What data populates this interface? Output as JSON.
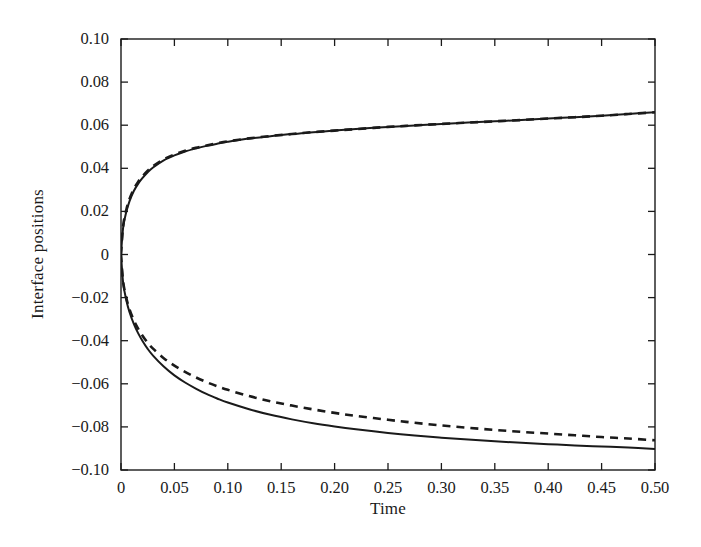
{
  "chart_data": {
    "type": "line",
    "title": "",
    "xlabel": "Time",
    "ylabel": "Interface positions",
    "xlim": [
      0,
      0.5
    ],
    "ylim": [
      -0.1,
      0.1
    ],
    "xticks": [
      0,
      0.05,
      0.1,
      0.15,
      0.2,
      0.25,
      0.3,
      0.35,
      0.4,
      0.45,
      0.5
    ],
    "xticklabels": [
      "0",
      "0.05",
      "0.10",
      "0.15",
      "0.20",
      "0.25",
      "0.30",
      "0.35",
      "0.40",
      "0.45",
      "0.50"
    ],
    "yticks": [
      -0.1,
      -0.08,
      -0.06,
      -0.04,
      -0.02,
      0,
      0.02,
      0.04,
      0.06,
      0.08,
      0.1
    ],
    "yticklabels": [
      "−0.10",
      "−0.08",
      "−0.06",
      "−0.04",
      "−0.02",
      "0",
      "0.02",
      "0.04",
      "0.06",
      "0.08",
      "0.10"
    ],
    "grid": false,
    "legend": null,
    "line_color": "#1a1a1a",
    "background_color": "#ffffff",
    "series": [
      {
        "name": "upper interface (solid)",
        "style": "solid",
        "x": [
          0,
          0.002,
          0.005,
          0.008,
          0.012,
          0.016,
          0.02,
          0.025,
          0.03,
          0.04,
          0.05,
          0.06,
          0.07,
          0.08,
          0.09,
          0.1,
          0.12,
          0.14,
          0.16,
          0.18,
          0.2,
          0.22,
          0.25,
          0.275,
          0.3,
          0.325,
          0.35,
          0.375,
          0.4,
          0.425,
          0.45,
          0.475,
          0.5
        ],
        "y": [
          0,
          0.0125,
          0.0198,
          0.0248,
          0.0295,
          0.0328,
          0.0354,
          0.0382,
          0.0404,
          0.0437,
          0.046,
          0.0478,
          0.0492,
          0.0504,
          0.0514,
          0.0523,
          0.0538,
          0.0549,
          0.0559,
          0.0567,
          0.0575,
          0.0582,
          0.0592,
          0.0599,
          0.0606,
          0.0612,
          0.0618,
          0.0624,
          0.0631,
          0.0637,
          0.0644,
          0.0652,
          0.066
        ]
      },
      {
        "name": "upper interface (dashed)",
        "style": "dashed",
        "x": [
          0,
          0.002,
          0.005,
          0.008,
          0.012,
          0.016,
          0.02,
          0.025,
          0.03,
          0.04,
          0.05,
          0.06,
          0.07,
          0.08,
          0.09,
          0.1,
          0.12,
          0.14,
          0.16,
          0.18,
          0.2,
          0.22,
          0.25,
          0.275,
          0.3,
          0.325,
          0.35,
          0.375,
          0.4,
          0.425,
          0.45,
          0.475,
          0.5
        ],
        "y": [
          0,
          0.0132,
          0.0208,
          0.0258,
          0.0304,
          0.0337,
          0.0362,
          0.0389,
          0.041,
          0.0442,
          0.0464,
          0.0481,
          0.0495,
          0.0506,
          0.0516,
          0.0525,
          0.0539,
          0.055,
          0.0559,
          0.0568,
          0.0575,
          0.0582,
          0.0592,
          0.0599,
          0.0606,
          0.0612,
          0.0618,
          0.0624,
          0.0631,
          0.0637,
          0.0644,
          0.0652,
          0.066
        ]
      },
      {
        "name": "lower interface (solid)",
        "style": "solid",
        "x": [
          0,
          0.002,
          0.005,
          0.008,
          0.012,
          0.016,
          0.02,
          0.025,
          0.03,
          0.04,
          0.05,
          0.06,
          0.07,
          0.08,
          0.09,
          0.1,
          0.12,
          0.14,
          0.16,
          0.18,
          0.2,
          0.22,
          0.25,
          0.275,
          0.3,
          0.325,
          0.35,
          0.375,
          0.4,
          0.425,
          0.45,
          0.475,
          0.5
        ],
        "y": [
          0,
          -0.0132,
          -0.0212,
          -0.0268,
          -0.0322,
          -0.0365,
          -0.04,
          -0.0438,
          -0.0469,
          -0.052,
          -0.0561,
          -0.0594,
          -0.0622,
          -0.0647,
          -0.0668,
          -0.0687,
          -0.0718,
          -0.0744,
          -0.0765,
          -0.0783,
          -0.0798,
          -0.0811,
          -0.0828,
          -0.084,
          -0.085,
          -0.0859,
          -0.0867,
          -0.0874,
          -0.088,
          -0.0886,
          -0.0891,
          -0.0896,
          -0.0902
        ]
      },
      {
        "name": "lower interface (dashed)",
        "style": "dashed",
        "x": [
          0,
          0.002,
          0.005,
          0.008,
          0.012,
          0.016,
          0.02,
          0.025,
          0.03,
          0.04,
          0.05,
          0.06,
          0.07,
          0.08,
          0.09,
          0.1,
          0.12,
          0.14,
          0.16,
          0.18,
          0.2,
          0.22,
          0.25,
          0.275,
          0.3,
          0.325,
          0.35,
          0.375,
          0.4,
          0.425,
          0.45,
          0.475,
          0.5
        ],
        "y": [
          0,
          -0.0126,
          -0.0202,
          -0.0255,
          -0.0305,
          -0.0344,
          -0.0376,
          -0.041,
          -0.0437,
          -0.0481,
          -0.0516,
          -0.0545,
          -0.057,
          -0.0592,
          -0.0611,
          -0.0628,
          -0.0657,
          -0.0681,
          -0.0701,
          -0.0719,
          -0.0735,
          -0.0749,
          -0.0767,
          -0.0781,
          -0.0793,
          -0.0804,
          -0.0814,
          -0.0823,
          -0.0831,
          -0.0839,
          -0.0847,
          -0.0854,
          -0.0862
        ]
      }
    ]
  },
  "figure": {
    "plot_left": 121,
    "plot_right": 655,
    "plot_top": 39,
    "plot_bottom": 470
  }
}
